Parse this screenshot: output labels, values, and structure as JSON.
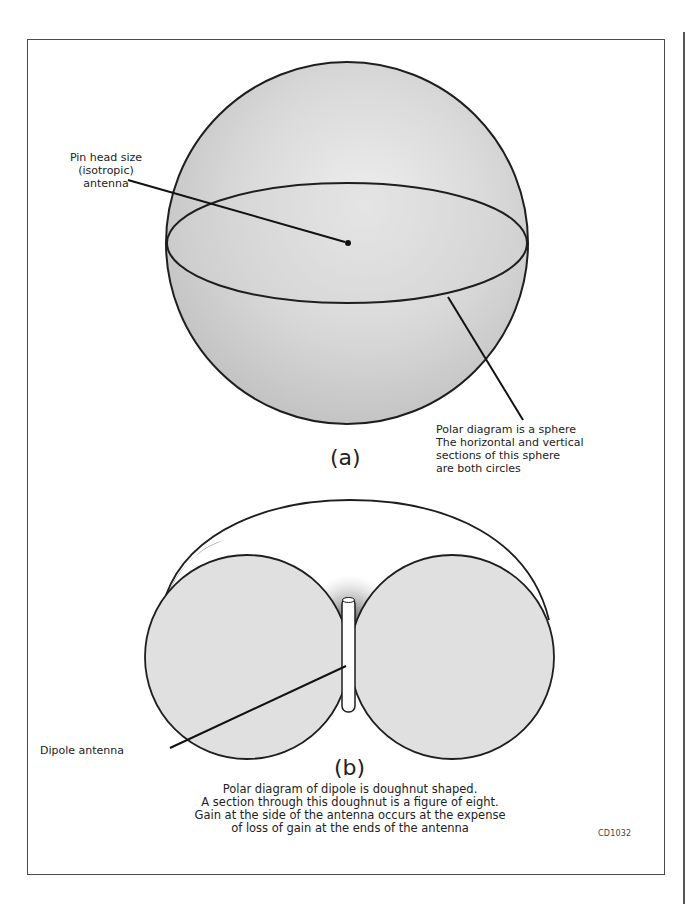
{
  "figure": {
    "code": "CD1032",
    "part_a": {
      "caption": "(a)",
      "label_isotropic": [
        "Pin head size",
        "(isotropic)",
        "antenna"
      ],
      "description": [
        "Polar diagram is a sphere",
        "The horizontal and vertical",
        "sections of this sphere",
        "are both circles"
      ]
    },
    "part_b": {
      "caption": "(b)",
      "label_dipole": "Dipole antenna",
      "description": [
        "Polar diagram of dipole is doughnut shaped.",
        "A section through this doughnut is a figure of eight.",
        "Gain at the side of the antenna occurs at the expense",
        "of loss of gain at the ends of the antenna"
      ]
    },
    "colors": {
      "fill": "#d9d9d9",
      "stroke": "#1e1e1e",
      "frame": "#4a4a4a"
    }
  }
}
